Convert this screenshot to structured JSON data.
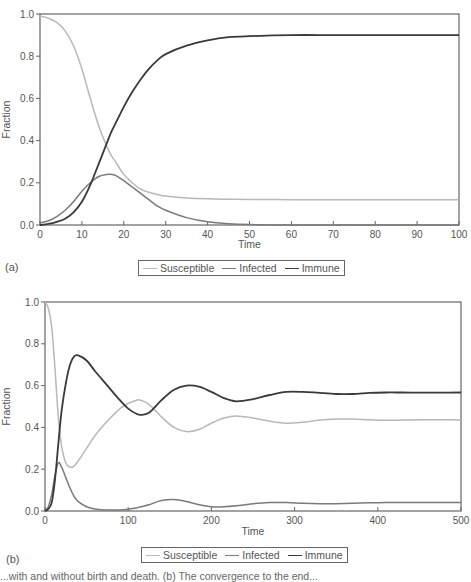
{
  "colors": {
    "susceptible": "#b8b8b8",
    "infected": "#7a7a7a",
    "immune": "#3a3a3a",
    "axis": "#666666"
  },
  "panels": [
    {
      "label": "(a)"
    },
    {
      "label": "(b)"
    }
  ],
  "legend": {
    "items": [
      {
        "label": "Susceptible",
        "series": "susceptible"
      },
      {
        "label": "Infected",
        "series": "infected"
      },
      {
        "label": "Immune",
        "series": "immune"
      }
    ]
  },
  "caption": "...with and without birth and death. (b) The convergence to the end...",
  "chart_data": [
    {
      "type": "line",
      "panel": "(a)",
      "title": "",
      "xlabel": "Time",
      "ylabel": "Fraction",
      "xlim": [
        0,
        100
      ],
      "ylim": [
        0,
        1.0
      ],
      "xticks": [
        0,
        10,
        20,
        30,
        40,
        50,
        60,
        70,
        80,
        90,
        100
      ],
      "yticks": [
        "0.0",
        "0.2",
        "0.4",
        "0.6",
        "0.8",
        "1.0"
      ],
      "grid": false,
      "legend_position": "bottom",
      "x": [
        0,
        2,
        4,
        6,
        8,
        10,
        12,
        14,
        16,
        17,
        18,
        20,
        22,
        24,
        26,
        28,
        30,
        35,
        40,
        45,
        50,
        60,
        70,
        80,
        90,
        100
      ],
      "series": [
        {
          "name": "Susceptible",
          "values": [
            0.99,
            0.98,
            0.96,
            0.92,
            0.85,
            0.74,
            0.6,
            0.47,
            0.37,
            0.33,
            0.3,
            0.24,
            0.2,
            0.17,
            0.155,
            0.145,
            0.137,
            0.128,
            0.124,
            0.122,
            0.121,
            0.12,
            0.12,
            0.12,
            0.12,
            0.12
          ]
        },
        {
          "name": "Infected",
          "values": [
            0.01,
            0.02,
            0.04,
            0.07,
            0.11,
            0.16,
            0.2,
            0.23,
            0.24,
            0.24,
            0.235,
            0.21,
            0.18,
            0.15,
            0.12,
            0.09,
            0.07,
            0.035,
            0.015,
            0.006,
            0.002,
            0.0,
            0.0,
            0.0,
            0.0,
            0.0
          ]
        },
        {
          "name": "Immune",
          "values": [
            0.0,
            0.005,
            0.015,
            0.03,
            0.06,
            0.11,
            0.19,
            0.29,
            0.39,
            0.44,
            0.48,
            0.56,
            0.63,
            0.69,
            0.74,
            0.78,
            0.81,
            0.85,
            0.875,
            0.89,
            0.895,
            0.9,
            0.9,
            0.9,
            0.9,
            0.9
          ]
        }
      ]
    },
    {
      "type": "line",
      "panel": "(b)",
      "title": "",
      "xlabel": "Time",
      "ylabel": "Fraction",
      "xlim": [
        0,
        500
      ],
      "ylim": [
        0,
        1.0
      ],
      "xticks": [
        0,
        100,
        200,
        300,
        400,
        500
      ],
      "yticks": [
        "0.0",
        "0.2",
        "0.4",
        "0.6",
        "0.8",
        "1.0"
      ],
      "grid": false,
      "legend_position": "bottom",
      "x": [
        0,
        4,
        8,
        12,
        16,
        20,
        25,
        30,
        35,
        40,
        50,
        60,
        75,
        90,
        100,
        110,
        115,
        125,
        140,
        155,
        170,
        185,
        200,
        215,
        230,
        250,
        270,
        290,
        310,
        330,
        350,
        370,
        390,
        410,
        430,
        450,
        470,
        500
      ],
      "series": [
        {
          "name": "Susceptible",
          "values": [
            1.0,
            0.97,
            0.88,
            0.68,
            0.45,
            0.31,
            0.23,
            0.21,
            0.215,
            0.24,
            0.3,
            0.36,
            0.43,
            0.49,
            0.515,
            0.53,
            0.53,
            0.51,
            0.45,
            0.4,
            0.38,
            0.39,
            0.42,
            0.445,
            0.455,
            0.445,
            0.43,
            0.42,
            0.425,
            0.435,
            0.44,
            0.44,
            0.437,
            0.434,
            0.435,
            0.437,
            0.437,
            0.436
          ]
        },
        {
          "name": "Infected",
          "values": [
            0.0,
            0.02,
            0.08,
            0.17,
            0.23,
            0.21,
            0.16,
            0.11,
            0.07,
            0.045,
            0.02,
            0.01,
            0.005,
            0.005,
            0.008,
            0.015,
            0.02,
            0.03,
            0.05,
            0.055,
            0.045,
            0.03,
            0.02,
            0.02,
            0.025,
            0.035,
            0.04,
            0.04,
            0.037,
            0.035,
            0.035,
            0.037,
            0.039,
            0.04,
            0.04,
            0.04,
            0.04,
            0.04
          ]
        },
        {
          "name": "Immune",
          "values": [
            0.0,
            0.01,
            0.04,
            0.15,
            0.32,
            0.48,
            0.61,
            0.7,
            0.74,
            0.745,
            0.72,
            0.67,
            0.6,
            0.53,
            0.49,
            0.465,
            0.46,
            0.47,
            0.53,
            0.58,
            0.6,
            0.595,
            0.57,
            0.54,
            0.525,
            0.535,
            0.555,
            0.57,
            0.57,
            0.565,
            0.56,
            0.56,
            0.565,
            0.567,
            0.567,
            0.566,
            0.566,
            0.567
          ]
        }
      ]
    }
  ]
}
